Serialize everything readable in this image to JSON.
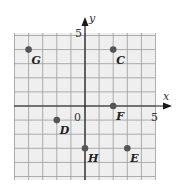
{
  "chart_data": {
    "type": "scatter",
    "title": "",
    "xlabel": "x",
    "ylabel": "y",
    "xlim": [
      -5,
      5
    ],
    "ylim": [
      -5,
      5
    ],
    "grid": true,
    "tick_labels": {
      "origin": "0",
      "x_max": "5",
      "y_max": "5"
    },
    "points": [
      {
        "label": "G",
        "x": -4,
        "y": 4
      },
      {
        "label": "C",
        "x": 2,
        "y": 4
      },
      {
        "label": "F",
        "x": 2,
        "y": 0
      },
      {
        "label": "D",
        "x": -2,
        "y": -1
      },
      {
        "label": "H",
        "x": 0,
        "y": -3
      },
      {
        "label": "E",
        "x": 3,
        "y": -3
      }
    ]
  },
  "colors": {
    "grid_background": "#efefef",
    "grid_line": "#9a9a9a",
    "axis": "#1a1a1a",
    "point": "#555555"
  }
}
